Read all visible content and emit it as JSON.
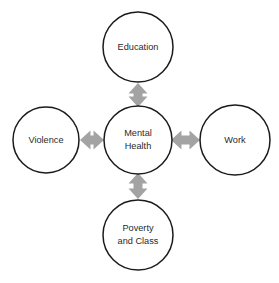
{
  "diagram": {
    "type": "hub-and-spoke",
    "canvas": {
      "width": 279,
      "height": 283,
      "background": "#ffffff"
    },
    "style": {
      "node_fill": "#ffffff",
      "node_stroke": "#1b1b1b",
      "label_color": "#2a2a2a",
      "arrow_color": "#a3a3a3"
    },
    "nodes": [
      {
        "id": "mental-health",
        "role": "hub",
        "lines": [
          "Mental",
          "Health"
        ],
        "cx": 138,
        "cy": 140,
        "r": 34
      },
      {
        "id": "education",
        "role": "spoke",
        "lines": [
          "Education"
        ],
        "cx": 138,
        "cy": 47,
        "r": 35
      },
      {
        "id": "violence",
        "role": "spoke",
        "lines": [
          "Violence"
        ],
        "cx": 46,
        "cy": 140,
        "r": 33
      },
      {
        "id": "work",
        "role": "spoke",
        "lines": [
          "Work"
        ],
        "cx": 235,
        "cy": 140,
        "r": 35
      },
      {
        "id": "poverty-and-class",
        "role": "spoke",
        "lines": [
          "Poverty",
          "and Class"
        ],
        "cx": 138,
        "cy": 235,
        "r": 35
      }
    ],
    "links": [
      {
        "id": "education-mental-health",
        "from": "education",
        "to": "mental-health",
        "direction": "bidirectional",
        "orientation": "vertical"
      },
      {
        "id": "violence-mental-health",
        "from": "violence",
        "to": "mental-health",
        "direction": "bidirectional",
        "orientation": "horizontal"
      },
      {
        "id": "work-mental-health",
        "from": "mental-health",
        "to": "work",
        "direction": "bidirectional",
        "orientation": "horizontal"
      },
      {
        "id": "poverty-mental-health",
        "from": "mental-health",
        "to": "poverty-and-class",
        "direction": "bidirectional",
        "orientation": "vertical"
      }
    ]
  }
}
